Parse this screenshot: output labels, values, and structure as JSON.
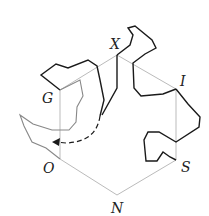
{
  "diagram": {
    "type": "hexagon-with-curves",
    "colors": {
      "edge": "#bbbbbb",
      "curve_dark": "#1a1a1a",
      "curve_gray": "#888888"
    },
    "vertices": [
      {
        "label": "X",
        "x": 117,
        "y": 55
      },
      {
        "label": "I",
        "x": 176,
        "y": 89
      },
      {
        "label": "S",
        "x": 176,
        "y": 160
      },
      {
        "label": "N",
        "x": 117,
        "y": 195
      },
      {
        "label": "O",
        "x": 60,
        "y": 159
      },
      {
        "label": "G",
        "x": 60,
        "y": 90
      }
    ],
    "labels": {
      "X": "X",
      "I": "I",
      "S": "S",
      "N": "N",
      "O": "O",
      "G": "G"
    },
    "arrow": {
      "style": "dashed",
      "from": "inner curve end near X",
      "to": "left near O"
    }
  }
}
